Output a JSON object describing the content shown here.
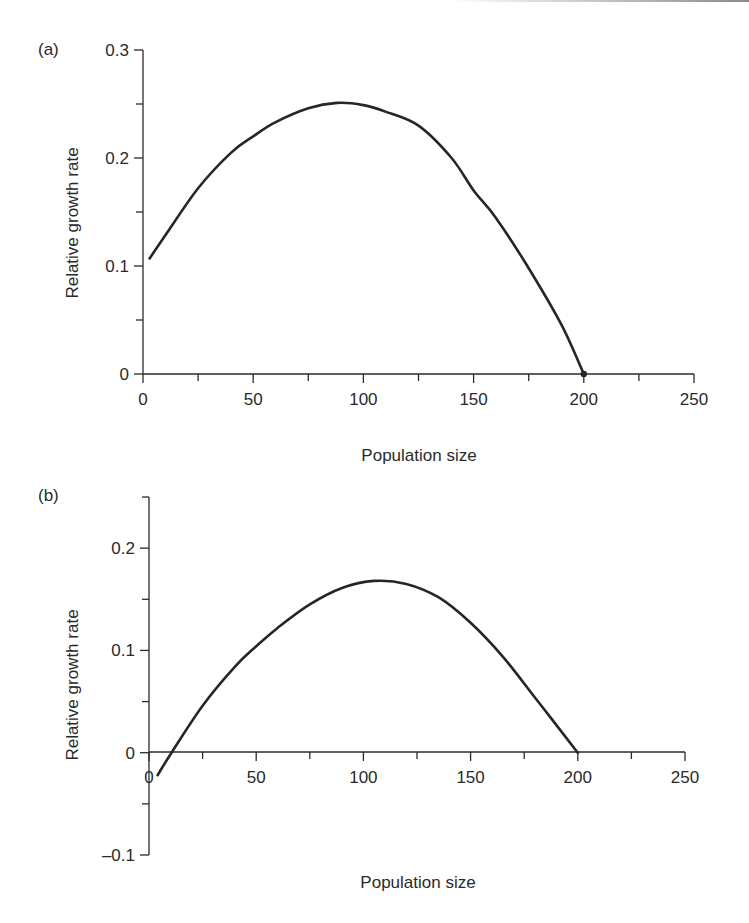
{
  "chart_data": [
    {
      "type": "line",
      "panel_label": "(a)",
      "title": "",
      "xlabel": "Population size",
      "ylabel": "Relative growth rate",
      "xlim": [
        0,
        250
      ],
      "ylim": [
        0,
        0.3
      ],
      "x_ticks": [
        0,
        50,
        100,
        150,
        200,
        250
      ],
      "x_tick_labels": [
        "0",
        "50",
        "100",
        "150",
        "200",
        "250"
      ],
      "x_minor_step": 25,
      "y_ticks": [
        0,
        0.1,
        0.2,
        0.3
      ],
      "y_tick_labels": [
        "0",
        "0.1",
        "0.2",
        "0.3"
      ],
      "y_minor_step": 0.05,
      "grid": false,
      "legend": null,
      "series": [
        {
          "name": "relative growth rate",
          "x": [
            3,
            10,
            25,
            40,
            50,
            60,
            75,
            88,
            100,
            110,
            125,
            140,
            150,
            160,
            175,
            190,
            200
          ],
          "y": [
            0.107,
            0.128,
            0.172,
            0.205,
            0.22,
            0.233,
            0.246,
            0.251,
            0.249,
            0.243,
            0.23,
            0.2,
            0.17,
            0.145,
            0.098,
            0.045,
            0.0
          ]
        }
      ],
      "annotations": [
        {
          "type": "point",
          "x": 200,
          "y": 0
        }
      ]
    },
    {
      "type": "line",
      "panel_label": "(b)",
      "title": "",
      "xlabel": "Population size",
      "ylabel": "Relative growth rate",
      "xlim": [
        0,
        250
      ],
      "ylim": [
        -0.1,
        0.25
      ],
      "x_ticks": [
        0,
        50,
        100,
        150,
        200,
        250
      ],
      "x_tick_labels": [
        "0",
        "50",
        "100",
        "150",
        "200",
        "250"
      ],
      "x_minor_step": 25,
      "y_ticks": [
        -0.1,
        0,
        0.1,
        0.2
      ],
      "y_tick_labels": [
        "–0.1",
        "0",
        "0.1",
        "0.2"
      ],
      "y_minor_step": 0.05,
      "grid": false,
      "legend": null,
      "series": [
        {
          "name": "relative growth rate",
          "x": [
            4,
            10.5,
            25,
            40,
            50,
            60,
            75,
            90,
            105,
            120,
            135,
            150,
            165,
            180,
            190,
            200
          ],
          "y": [
            -0.022,
            0.0,
            0.046,
            0.084,
            0.104,
            0.122,
            0.145,
            0.161,
            0.168,
            0.165,
            0.152,
            0.127,
            0.094,
            0.054,
            0.027,
            0.0
          ]
        }
      ]
    }
  ]
}
